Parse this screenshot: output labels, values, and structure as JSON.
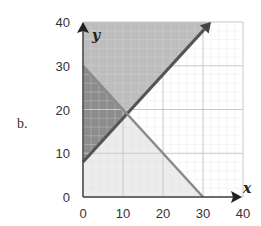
{
  "part_label": "b.",
  "chart_data": {
    "type": "area",
    "title": "",
    "xlabel": "x",
    "ylabel": "y",
    "xlim": [
      0,
      40
    ],
    "ylim": [
      0,
      40
    ],
    "x_ticks": [
      0,
      10,
      20,
      30,
      40
    ],
    "y_ticks": [
      0,
      10,
      20,
      30,
      40
    ],
    "grid": true,
    "lines": [
      {
        "name": "rising boundary",
        "equation": "y = x + 8",
        "points": [
          [
            0,
            8
          ],
          [
            32,
            40
          ]
        ],
        "arrow_end": true
      },
      {
        "name": "falling boundary",
        "equation": "x + y = 30",
        "points": [
          [
            0,
            30
          ],
          [
            30,
            0
          ]
        ]
      }
    ],
    "regions": [
      {
        "name": "above both lines",
        "shade": "medium",
        "color": "#bdbdbd",
        "polygon": [
          [
            0,
            30
          ],
          [
            11,
            19
          ],
          [
            32,
            40
          ],
          [
            0,
            40
          ]
        ]
      },
      {
        "name": "between lines (left)",
        "shade": "dark",
        "color": "#8c8c8c",
        "polygon": [
          [
            0,
            8
          ],
          [
            11,
            19
          ],
          [
            0,
            30
          ]
        ]
      },
      {
        "name": "below both lines",
        "shade": "light",
        "color": "#ececec",
        "polygon": [
          [
            0,
            0
          ],
          [
            30,
            0
          ],
          [
            11,
            19
          ],
          [
            0,
            8
          ]
        ]
      }
    ],
    "intersection": [
      11,
      19
    ]
  }
}
